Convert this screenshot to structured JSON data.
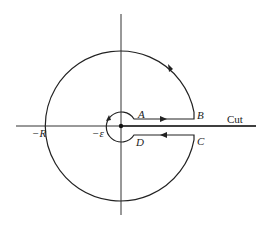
{
  "diagram": {
    "type": "keyhole-contour",
    "labels": {
      "A": "A",
      "B": "B",
      "C": "C",
      "D": "D",
      "neg_R": "−R",
      "neg_eps": "−ε",
      "cut": "Cut"
    },
    "colors": {
      "stroke": "#222222",
      "background": "#ffffff"
    }
  }
}
